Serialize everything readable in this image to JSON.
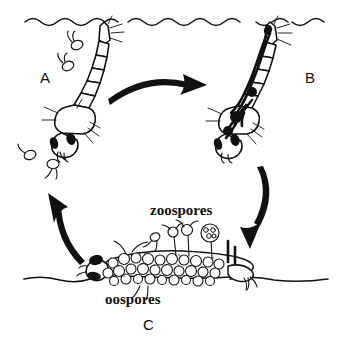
{
  "diagram": {
    "background_color": "#ffffff",
    "ink_color": "#111111"
  },
  "labels": {
    "stage_a": "A",
    "stage_b": "B",
    "stage_c": "C",
    "zoospores": "zoospores",
    "oospores": "oospores"
  },
  "scene": {
    "water_surface_name": "water-surface-line",
    "substrate_name": "substrate-line"
  },
  "arrows": [
    {
      "name": "arrow-a-to-b",
      "direction": "right"
    },
    {
      "name": "arrow-b-to-c",
      "direction": "down-left"
    },
    {
      "name": "arrow-c-to-a",
      "direction": "up"
    }
  ],
  "organisms": [
    {
      "name": "larva-healthy",
      "stage": "A"
    },
    {
      "name": "larva-infected",
      "stage": "B"
    },
    {
      "name": "larva-cadaver",
      "stage": "C"
    }
  ]
}
